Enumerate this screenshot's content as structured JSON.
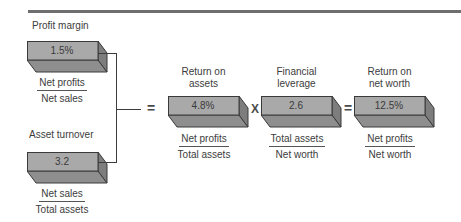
{
  "title_rule": true,
  "inputs": {
    "profit_margin": {
      "label": "Profit margin",
      "value": "1.5%",
      "numerator": "Net profits",
      "denominator": "Net sales"
    },
    "asset_turnover": {
      "label": "Asset turnover",
      "value": "3.2",
      "numerator": "Net sales",
      "denominator": "Total assets"
    }
  },
  "equation": {
    "operators": {
      "eq1": "=",
      "times": "X",
      "eq2": "="
    },
    "return_on_assets": {
      "label_line1": "Return on",
      "label_line2": "assets",
      "value": "4.8%",
      "numerator": "Net profits",
      "denominator": "Total assets"
    },
    "financial_leverage": {
      "label_line1": "Financial",
      "label_line2": "leverage",
      "value": "2.6",
      "numerator": "Total assets",
      "denominator": "Net worth"
    },
    "return_on_net_worth": {
      "label_line1": "Return on",
      "label_line2": "net worth",
      "value": "12.5%",
      "numerator": "Net profits",
      "denominator": "Net worth"
    }
  },
  "colors": {
    "box_front": "#a9a9a9",
    "box_side": "#7d7d7d",
    "box_bottom": "#8e8e8e",
    "rule": "#6e6e6e"
  }
}
